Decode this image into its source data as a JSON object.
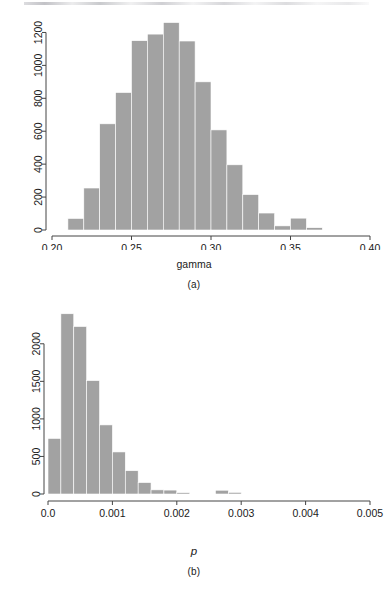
{
  "figure": {
    "background": "#ffffff",
    "bar_color": "#a2a2a2",
    "axis_color": "#444444",
    "text_color": "#1a1a1a"
  },
  "panels": [
    {
      "id": "a",
      "caption": "(a)",
      "xlabel": "gamma",
      "xlabel_italic": false
    },
    {
      "id": "b",
      "caption": "(b)",
      "xlabel": "p",
      "xlabel_italic": true
    }
  ],
  "chart_data": [
    {
      "type": "bar",
      "panel": "a",
      "title": "",
      "xlabel": "gamma",
      "ylabel": "",
      "xlim": [
        0.2,
        0.4
      ],
      "ylim": [
        0,
        1300
      ],
      "xticks": [
        0.2,
        0.25,
        0.3,
        0.35,
        0.4
      ],
      "xticklabels": [
        "0.20",
        "0.25",
        "0.30",
        "0.35",
        "0.40"
      ],
      "yticks": [
        0,
        200,
        400,
        600,
        800,
        1000,
        1200
      ],
      "yticklabels": [
        "0",
        "200",
        "400",
        "600",
        "800",
        "1000",
        "1200"
      ],
      "grid": false,
      "legend": null,
      "bin_width": 0.005,
      "bin_edges": [
        0.21,
        0.215,
        0.22,
        0.225,
        0.23,
        0.235,
        0.24,
        0.245,
        0.25,
        0.255,
        0.26,
        0.265,
        0.27,
        0.275,
        0.28,
        0.285,
        0.29,
        0.295,
        0.3,
        0.305,
        0.31,
        0.315,
        0.32,
        0.325,
        0.33,
        0.335,
        0.34,
        0.345,
        0.35,
        0.355,
        0.36,
        0.365,
        0.37
      ],
      "categories": [
        "0.2125",
        "0.2225",
        "0.2325",
        "0.2425",
        "0.2525",
        "0.2625",
        "0.2725",
        "0.2825",
        "0.2925",
        "0.3025",
        "0.3125",
        "0.3225",
        "0.3325",
        "0.3425",
        "0.3525",
        "0.3625"
      ],
      "bars": [
        {
          "x0": 0.21,
          "x1": 0.22,
          "value": 70
        },
        {
          "x0": 0.22,
          "x1": 0.23,
          "value": 255
        },
        {
          "x0": 0.23,
          "x1": 0.24,
          "value": 645
        },
        {
          "x0": 0.24,
          "x1": 0.25,
          "value": 835
        },
        {
          "x0": 0.25,
          "x1": 0.26,
          "value": 1150
        },
        {
          "x0": 0.26,
          "x1": 0.27,
          "value": 1190
        },
        {
          "x0": 0.27,
          "x1": 0.28,
          "value": 1260
        },
        {
          "x0": 0.28,
          "x1": 0.29,
          "value": 1148
        },
        {
          "x0": 0.29,
          "x1": 0.3,
          "value": 900
        },
        {
          "x0": 0.3,
          "x1": 0.31,
          "value": 608
        },
        {
          "x0": 0.31,
          "x1": 0.32,
          "value": 396
        },
        {
          "x0": 0.32,
          "x1": 0.33,
          "value": 215
        },
        {
          "x0": 0.33,
          "x1": 0.34,
          "value": 103
        },
        {
          "x0": 0.34,
          "x1": 0.35,
          "value": 25
        },
        {
          "x0": 0.35,
          "x1": 0.36,
          "value": 72
        },
        {
          "x0": 0.36,
          "x1": 0.37,
          "value": 14
        }
      ],
      "values": [
        70,
        255,
        645,
        835,
        1150,
        1190,
        1260,
        1148,
        900,
        608,
        396,
        215,
        103,
        25,
        72,
        14
      ]
    },
    {
      "type": "bar",
      "panel": "b",
      "title": "",
      "xlabel": "p",
      "ylabel": "",
      "xlim": [
        0.0,
        0.005
      ],
      "ylim": [
        0,
        2450
      ],
      "xticks": [
        0.0,
        0.001,
        0.002,
        0.003,
        0.004,
        0.005
      ],
      "xticklabels": [
        "0.0",
        "0.001",
        "0.002",
        "0.003",
        "0.004",
        "0.005"
      ],
      "yticks": [
        0,
        500,
        1000,
        1500,
        2000
      ],
      "yticklabels": [
        "0",
        "500",
        "1000",
        "1500",
        "2000"
      ],
      "grid": false,
      "legend": null,
      "bin_width": 0.0002,
      "categories": [
        "0.0001",
        "0.0003",
        "0.0005",
        "0.0007",
        "0.0009",
        "0.0011",
        "0.0013",
        "0.0015",
        "0.0017",
        "0.0019",
        "0.0021",
        "0.0023",
        "0.0025",
        "0.0027",
        "0.0029",
        "0.0031"
      ],
      "bars": [
        {
          "x0": 0.0,
          "x1": 0.0002,
          "value": 740
        },
        {
          "x0": 0.0002,
          "x1": 0.0004,
          "value": 2400
        },
        {
          "x0": 0.0004,
          "x1": 0.0006,
          "value": 2230
        },
        {
          "x0": 0.0006,
          "x1": 0.0008,
          "value": 1510
        },
        {
          "x0": 0.0008,
          "x1": 0.001,
          "value": 920
        },
        {
          "x0": 0.001,
          "x1": 0.0012,
          "value": 560
        },
        {
          "x0": 0.0012,
          "x1": 0.0014,
          "value": 310
        },
        {
          "x0": 0.0014,
          "x1": 0.0016,
          "value": 152
        },
        {
          "x0": 0.0016,
          "x1": 0.0018,
          "value": 55
        },
        {
          "x0": 0.0018,
          "x1": 0.002,
          "value": 52
        },
        {
          "x0": 0.002,
          "x1": 0.0022,
          "value": 18
        },
        {
          "x0": 0.0026,
          "x1": 0.0028,
          "value": 50
        },
        {
          "x0": 0.0028,
          "x1": 0.003,
          "value": 22
        }
      ],
      "values": [
        740,
        2400,
        2230,
        1510,
        920,
        560,
        310,
        152,
        55,
        52,
        18,
        50,
        22
      ]
    }
  ]
}
